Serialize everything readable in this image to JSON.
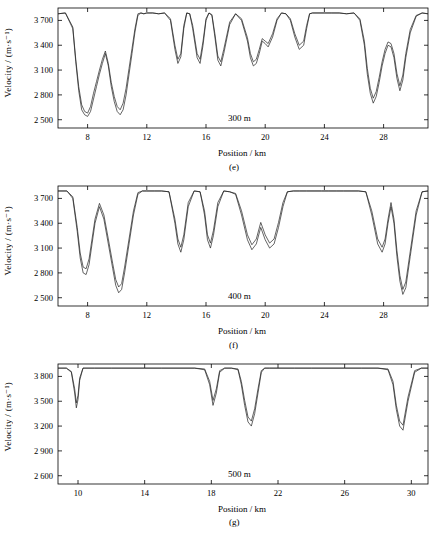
{
  "figure": {
    "background": "#ffffff",
    "line_color": "#222222",
    "axis_color": "#000000"
  },
  "chart_data": [
    {
      "type": "line",
      "panel_label": "(e)",
      "annotation": "300 m",
      "xlabel": "Position / km",
      "ylabel": "Velocity / (m·s⁻¹)",
      "grid": false,
      "legend": "none",
      "xlim": [
        6.0,
        31.0
      ],
      "ylim": [
        2400,
        3850
      ],
      "xticks": [
        8,
        12,
        16,
        20,
        24,
        28
      ],
      "yticks": [
        2500,
        2800,
        3100,
        3400,
        3700
      ],
      "ytick_labels": [
        "2 500",
        "2 800",
        "3 100",
        "3 400",
        "3 700"
      ],
      "series": [
        {
          "name": "velocity-curve-a",
          "x": [
            6.0,
            6.5,
            7.0,
            7.2,
            7.4,
            7.6,
            7.8,
            8.0,
            8.2,
            8.4,
            8.6,
            8.8,
            9.0,
            9.2,
            9.4,
            9.6,
            9.8,
            10.0,
            10.2,
            10.4,
            10.6,
            10.8,
            11.0,
            11.2,
            11.4,
            11.6,
            11.8,
            12.0,
            12.4,
            12.8,
            13.2,
            13.6,
            13.9,
            14.1,
            14.3,
            14.5,
            14.7,
            14.9,
            15.1,
            15.4,
            15.6,
            15.8,
            16.0,
            16.2,
            16.4,
            16.6,
            16.8,
            17.0,
            17.2,
            17.6,
            18.0,
            18.4,
            18.8,
            19.0,
            19.2,
            19.4,
            19.6,
            19.8,
            20.0,
            20.2,
            20.5,
            20.8,
            21.1,
            21.4,
            21.7,
            22.0,
            22.3,
            22.6,
            22.8,
            23.0,
            23.2,
            23.5,
            24.0,
            24.5,
            25.0,
            25.5,
            26.0,
            26.4,
            26.7,
            26.9,
            27.1,
            27.3,
            27.5,
            27.7,
            27.9,
            28.1,
            28.3,
            28.5,
            28.7,
            28.9,
            29.1,
            29.3,
            29.5,
            29.8,
            30.2,
            30.6,
            31.0
          ],
          "y": [
            3780,
            3790,
            3600,
            3200,
            2850,
            2620,
            2560,
            2540,
            2600,
            2750,
            2900,
            3050,
            3180,
            3300,
            3150,
            2900,
            2720,
            2600,
            2560,
            2620,
            2800,
            3050,
            3300,
            3560,
            3760,
            3790,
            3780,
            3790,
            3790,
            3780,
            3790,
            3700,
            3350,
            3180,
            3260,
            3600,
            3790,
            3780,
            3600,
            3250,
            3180,
            3400,
            3700,
            3790,
            3760,
            3500,
            3220,
            3150,
            3300,
            3650,
            3780,
            3700,
            3450,
            3250,
            3150,
            3180,
            3300,
            3450,
            3420,
            3380,
            3500,
            3700,
            3790,
            3780,
            3700,
            3500,
            3350,
            3400,
            3600,
            3780,
            3790,
            3790,
            3790,
            3790,
            3790,
            3780,
            3790,
            3700,
            3400,
            3050,
            2820,
            2700,
            2780,
            2950,
            3150,
            3300,
            3400,
            3380,
            3250,
            3000,
            2850,
            2980,
            3250,
            3550,
            3750,
            3790,
            3780
          ]
        },
        {
          "name": "velocity-curve-b",
          "x": [
            6.0,
            6.5,
            7.0,
            7.2,
            7.4,
            7.6,
            7.8,
            8.0,
            8.2,
            8.4,
            8.6,
            8.8,
            9.0,
            9.2,
            9.4,
            9.6,
            9.8,
            10.0,
            10.2,
            10.4,
            10.6,
            10.8,
            11.0,
            11.2,
            11.4,
            11.6,
            11.8,
            12.0,
            12.4,
            12.8,
            13.2,
            13.6,
            13.9,
            14.1,
            14.3,
            14.5,
            14.7,
            14.9,
            15.1,
            15.4,
            15.6,
            15.8,
            16.0,
            16.2,
            16.4,
            16.6,
            16.8,
            17.0,
            17.2,
            17.6,
            18.0,
            18.4,
            18.8,
            19.0,
            19.2,
            19.4,
            19.6,
            19.8,
            20.0,
            20.2,
            20.5,
            20.8,
            21.1,
            21.4,
            21.7,
            22.0,
            22.3,
            22.6,
            22.8,
            23.0,
            23.2,
            23.5,
            24.0,
            24.5,
            25.0,
            25.5,
            26.0,
            26.4,
            26.7,
            26.9,
            27.1,
            27.3,
            27.5,
            27.7,
            27.9,
            28.1,
            28.3,
            28.5,
            28.7,
            28.9,
            29.1,
            29.3,
            29.5,
            29.8,
            30.2,
            30.6,
            31.0
          ],
          "y": [
            3780,
            3790,
            3620,
            3230,
            2900,
            2680,
            2600,
            2580,
            2660,
            2820,
            2960,
            3100,
            3230,
            3330,
            3180,
            2950,
            2780,
            2660,
            2620,
            2700,
            2880,
            3120,
            3360,
            3600,
            3780,
            3790,
            3780,
            3790,
            3790,
            3780,
            3790,
            3720,
            3400,
            3230,
            3300,
            3640,
            3790,
            3780,
            3640,
            3300,
            3230,
            3450,
            3720,
            3790,
            3770,
            3540,
            3270,
            3200,
            3350,
            3680,
            3780,
            3720,
            3490,
            3300,
            3200,
            3230,
            3350,
            3480,
            3450,
            3420,
            3540,
            3720,
            3790,
            3780,
            3720,
            3540,
            3400,
            3450,
            3640,
            3780,
            3790,
            3790,
            3790,
            3790,
            3790,
            3780,
            3790,
            3720,
            3450,
            3120,
            2880,
            2760,
            2840,
            3010,
            3200,
            3350,
            3440,
            3420,
            3300,
            3060,
            2910,
            3040,
            3300,
            3590,
            3760,
            3790,
            3780
          ]
        }
      ]
    },
    {
      "type": "line",
      "panel_label": "(f)",
      "annotation": "400 m",
      "xlabel": "Position / km",
      "ylabel": "Velocity / (m·s⁻¹)",
      "grid": false,
      "legend": "none",
      "xlim": [
        6.0,
        31.0
      ],
      "ylim": [
        2400,
        3850
      ],
      "xticks": [
        8,
        12,
        16,
        20,
        24,
        28
      ],
      "yticks": [
        2500,
        2800,
        3100,
        3400,
        3700
      ],
      "ytick_labels": [
        "2 500",
        "2 800",
        "3 100",
        "3 400",
        "3 700"
      ],
      "series": [
        {
          "name": "velocity-curve-a",
          "x": [
            6.0,
            6.6,
            7.0,
            7.3,
            7.5,
            7.7,
            7.9,
            8.1,
            8.3,
            8.5,
            8.8,
            9.1,
            9.4,
            9.7,
            9.9,
            10.1,
            10.3,
            10.5,
            10.8,
            11.1,
            11.4,
            11.7,
            12.0,
            12.5,
            13.0,
            13.5,
            13.9,
            14.1,
            14.3,
            14.5,
            14.8,
            15.2,
            15.6,
            15.9,
            16.1,
            16.3,
            16.5,
            16.8,
            17.2,
            17.6,
            18.0,
            18.4,
            18.8,
            19.1,
            19.4,
            19.7,
            20.0,
            20.3,
            20.6,
            20.9,
            21.2,
            21.5,
            21.9,
            22.3,
            22.8,
            23.3,
            23.8,
            24.3,
            24.8,
            25.3,
            25.8,
            26.3,
            26.8,
            27.2,
            27.6,
            27.9,
            28.1,
            28.3,
            28.5,
            28.7,
            28.9,
            29.1,
            29.3,
            29.5,
            29.8,
            30.2,
            30.6,
            31.0
          ],
          "y": [
            3790,
            3790,
            3700,
            3300,
            2980,
            2800,
            2780,
            2900,
            3150,
            3400,
            3600,
            3450,
            3150,
            2850,
            2650,
            2560,
            2600,
            2800,
            3150,
            3500,
            3750,
            3790,
            3790,
            3790,
            3790,
            3780,
            3400,
            3150,
            3050,
            3200,
            3600,
            3790,
            3780,
            3500,
            3200,
            3100,
            3250,
            3600,
            3790,
            3780,
            3750,
            3500,
            3200,
            3080,
            3150,
            3350,
            3200,
            3100,
            3150,
            3350,
            3600,
            3780,
            3790,
            3790,
            3790,
            3790,
            3790,
            3790,
            3790,
            3790,
            3790,
            3790,
            3780,
            3500,
            3150,
            3050,
            3150,
            3400,
            3600,
            3400,
            3000,
            2700,
            2540,
            2620,
            3000,
            3500,
            3780,
            3790
          ]
        },
        {
          "name": "velocity-curve-b",
          "x": [
            6.0,
            6.6,
            7.0,
            7.3,
            7.5,
            7.7,
            7.9,
            8.1,
            8.3,
            8.5,
            8.8,
            9.1,
            9.4,
            9.7,
            9.9,
            10.1,
            10.3,
            10.5,
            10.8,
            11.1,
            11.4,
            11.7,
            12.0,
            12.5,
            13.0,
            13.5,
            13.9,
            14.1,
            14.3,
            14.5,
            14.8,
            15.2,
            15.6,
            15.9,
            16.1,
            16.3,
            16.5,
            16.8,
            17.2,
            17.6,
            18.0,
            18.4,
            18.8,
            19.1,
            19.4,
            19.7,
            20.0,
            20.3,
            20.6,
            20.9,
            21.2,
            21.5,
            21.9,
            22.3,
            22.8,
            23.3,
            23.8,
            24.3,
            24.8,
            25.3,
            25.8,
            26.3,
            26.8,
            27.2,
            27.6,
            27.9,
            28.1,
            28.3,
            28.5,
            28.7,
            28.9,
            29.1,
            29.3,
            29.5,
            29.8,
            30.2,
            30.6,
            31.0
          ],
          "y": [
            3790,
            3790,
            3720,
            3350,
            3040,
            2870,
            2850,
            2970,
            3210,
            3450,
            3640,
            3500,
            3210,
            2910,
            2720,
            2630,
            2670,
            2870,
            3210,
            3550,
            3770,
            3790,
            3790,
            3790,
            3790,
            3780,
            3450,
            3210,
            3110,
            3260,
            3650,
            3790,
            3780,
            3550,
            3260,
            3160,
            3310,
            3650,
            3790,
            3780,
            3760,
            3550,
            3260,
            3140,
            3210,
            3410,
            3260,
            3160,
            3210,
            3410,
            3650,
            3780,
            3790,
            3790,
            3790,
            3790,
            3790,
            3790,
            3790,
            3790,
            3790,
            3790,
            3780,
            3550,
            3210,
            3110,
            3210,
            3450,
            3650,
            3450,
            3070,
            2770,
            2600,
            2690,
            3060,
            3550,
            3780,
            3790
          ]
        }
      ]
    },
    {
      "type": "line",
      "panel_label": "(g)",
      "annotation": "500 m",
      "xlabel": "Position / km",
      "ylabel": "Velocity / (m·s⁻¹)",
      "grid": false,
      "legend": "none",
      "xlim": [
        8.8,
        31.0
      ],
      "ylim": [
        2500,
        3950
      ],
      "xticks": [
        10,
        14,
        18,
        22,
        26,
        30
      ],
      "yticks": [
        2600,
        2900,
        3200,
        3500,
        3800
      ],
      "ytick_labels": [
        "2 600",
        "2 900",
        "3 200",
        "3 500",
        "3 800"
      ],
      "series": [
        {
          "name": "velocity-curve-a",
          "x": [
            8.8,
            9.3,
            9.6,
            9.8,
            9.9,
            10.0,
            10.1,
            10.3,
            10.6,
            11.0,
            12.0,
            13.0,
            14.0,
            15.0,
            16.0,
            17.0,
            17.6,
            17.9,
            18.1,
            18.3,
            18.5,
            18.8,
            19.2,
            19.6,
            19.8,
            20.0,
            20.2,
            20.4,
            20.6,
            20.8,
            21.0,
            21.2,
            21.5,
            22.0,
            23.0,
            24.0,
            25.0,
            26.0,
            27.0,
            28.0,
            28.6,
            28.9,
            29.1,
            29.3,
            29.5,
            29.8,
            30.2,
            30.6,
            31.0
          ],
          "y": [
            3900,
            3900,
            3850,
            3600,
            3420,
            3520,
            3750,
            3900,
            3900,
            3900,
            3900,
            3900,
            3900,
            3900,
            3900,
            3900,
            3880,
            3700,
            3450,
            3600,
            3850,
            3900,
            3900,
            3880,
            3700,
            3450,
            3250,
            3200,
            3350,
            3600,
            3850,
            3900,
            3900,
            3900,
            3900,
            3900,
            3900,
            3900,
            3900,
            3900,
            3880,
            3700,
            3400,
            3200,
            3150,
            3500,
            3850,
            3900,
            3900
          ]
        },
        {
          "name": "velocity-curve-b",
          "x": [
            8.8,
            9.3,
            9.6,
            9.8,
            9.9,
            10.0,
            10.1,
            10.3,
            10.6,
            11.0,
            12.0,
            13.0,
            14.0,
            15.0,
            16.0,
            17.0,
            17.6,
            17.9,
            18.1,
            18.3,
            18.5,
            18.8,
            19.2,
            19.6,
            19.8,
            20.0,
            20.2,
            20.4,
            20.6,
            20.8,
            21.0,
            21.2,
            21.5,
            22.0,
            23.0,
            24.0,
            25.0,
            26.0,
            27.0,
            28.0,
            28.6,
            28.9,
            29.1,
            29.3,
            29.5,
            29.8,
            30.2,
            30.6,
            31.0
          ],
          "y": [
            3900,
            3900,
            3860,
            3650,
            3480,
            3570,
            3780,
            3900,
            3900,
            3900,
            3900,
            3900,
            3900,
            3900,
            3900,
            3900,
            3890,
            3740,
            3510,
            3650,
            3870,
            3900,
            3900,
            3890,
            3740,
            3510,
            3310,
            3260,
            3410,
            3650,
            3870,
            3900,
            3900,
            3900,
            3900,
            3900,
            3900,
            3900,
            3900,
            3900,
            3890,
            3740,
            3450,
            3260,
            3210,
            3550,
            3870,
            3900,
            3900
          ]
        }
      ]
    }
  ]
}
